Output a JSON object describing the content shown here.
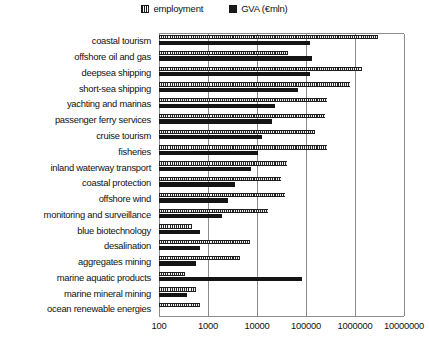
{
  "chart": {
    "type": "bar",
    "orientation": "horizontal",
    "title": "",
    "xlabel": "",
    "ylabel": ""
  },
  "legend": {
    "position": "top-center",
    "items": [
      {
        "label": "employment",
        "swatch": "hatched-square-icon",
        "color": "#262626"
      },
      {
        "label": "GVA (€mln)",
        "swatch": "filled-square-icon",
        "color": "#141414"
      }
    ]
  },
  "axis": {
    "scale": "log10",
    "xmin": 100,
    "xmax": 10000000,
    "ticks": [
      "100",
      "1000",
      "10000",
      "100000",
      "1000000",
      "10000000"
    ],
    "gridlines": true
  },
  "chart_data": {
    "type": "bar",
    "orientation": "horizontal",
    "scale": "log10",
    "title": "",
    "xlabel": "",
    "ylabel": "",
    "xlim": [
      100,
      10000000
    ],
    "xticks": [
      100,
      1000,
      10000,
      100000,
      1000000,
      10000000
    ],
    "grid": true,
    "legend_position": "top-center",
    "categories": [
      "coastal tourism",
      "offshore oil and gas",
      "deepsea shipping",
      "short-sea shipping",
      "yachting and marinas",
      "passenger ferry services",
      "cruise tourism",
      "fisheries",
      "inland waterway transport",
      "coastal protection",
      "offshore wind",
      "monitoring and surveillance",
      "blue biotechnology",
      "desalination",
      "aggregates mining",
      "marine aquatic products",
      "marine mineral mining",
      "ocean renewable energies"
    ],
    "series": [
      {
        "name": "employment",
        "unit": "persons",
        "values": [
          2200000,
          400000,
          900000,
          600000,
          280000,
          270000,
          210000,
          280000,
          88000,
          62000,
          73000,
          42000,
          4500,
          28000,
          19000,
          3200,
          6000,
          7500
        ]
      },
      {
        "name": "GVA (€mln)",
        "unit": "€ million",
        "values": [
          130000,
          150000,
          130000,
          62000,
          22000,
          20000,
          13500,
          11500,
          9500,
          5000,
          3600,
          2800,
          6500,
          6500,
          5200,
          130000,
          2000,
          null
        ]
      }
    ]
  },
  "bars": [
    {
      "category": "coastal tourism",
      "employment_px": 219,
      "gva_px": 151
    },
    {
      "category": "offshore oil and gas",
      "employment_px": 129,
      "gva_px": 153
    },
    {
      "category": "deepsea shipping",
      "employment_px": 203,
      "gva_px": 151
    },
    {
      "category": "short-sea shipping",
      "employment_px": 191,
      "gva_px": 139
    },
    {
      "category": "yachting and marinas",
      "employment_px": 168,
      "gva_px": 116
    },
    {
      "category": "passenger ferry services",
      "employment_px": 166,
      "gva_px": 113
    },
    {
      "category": "cruise tourism",
      "employment_px": 156,
      "gva_px": 103
    },
    {
      "category": "fisheries",
      "employment_px": 168,
      "gva_px": 99
    },
    {
      "category": "inland waterway transport",
      "employment_px": 128,
      "gva_px": 92
    },
    {
      "category": "coastal protection",
      "employment_px": 122,
      "gva_px": 76
    },
    {
      "category": "offshore wind",
      "employment_px": 126,
      "gva_px": 69
    },
    {
      "category": "monitoring and surveillance",
      "employment_px": 109,
      "gva_px": 63
    },
    {
      "category": "blue biotechnology",
      "employment_px": 33,
      "gva_px": 41
    },
    {
      "category": "desalination",
      "employment_px": 91,
      "gva_px": 41
    },
    {
      "category": "aggregates mining",
      "employment_px": 81,
      "gva_px": 37
    },
    {
      "category": "marine aquatic products",
      "employment_px": 26,
      "gva_px": 143
    },
    {
      "category": "marine mineral mining",
      "employment_px": 37,
      "gva_px": 28
    },
    {
      "category": "ocean renewable energies",
      "employment_px": 41,
      "gva_px": 0
    }
  ]
}
